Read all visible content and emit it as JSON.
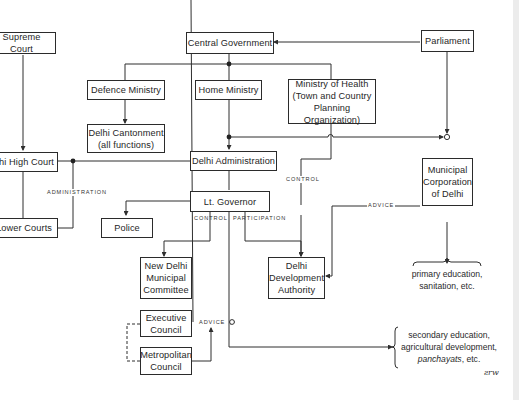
{
  "nodes": {
    "supreme_court": "Supreme Court",
    "central_government": "Central Government",
    "parliament": "Parliament",
    "defence_ministry": "Defence Ministry",
    "home_ministry": "Home Ministry",
    "ministry_of_health": "Ministry of Health\n(Town and Country\nPlanning Organization)",
    "delhi_cantonment": "Delhi Cantonment\n(all functions)",
    "delhi_high_court": "Delhi High Court",
    "delhi_administration": "Delhi Administration",
    "municipal_corporation": "Municipal\nCorporation\nof Delhi",
    "lower_courts": "Lower Courts",
    "police": "Police",
    "lt_governor": "Lt. Governor",
    "new_delhi_municipal_committee": "New Delhi\nMunicipal\nCommittee",
    "delhi_development_authority": "Delhi\nDevelopment\nAuthority",
    "executive_council": "Executive\nCouncil",
    "metropolitan_council": "Metropolitan\nCouncil"
  },
  "edge_labels": {
    "administration": "ADMINISTRATION",
    "control_health": "CONTROL",
    "advice_mcd": "ADVICE",
    "control_ltg": "CONTROL",
    "participation": "PARTICIPATION",
    "advice_council": "ADVICE"
  },
  "notes": {
    "mcd_functions_line1": "primary education,",
    "mcd_functions_line2": "sanitation, etc.",
    "admin_functions_line1": "secondary education,",
    "admin_functions_line2": "agricultural development,",
    "admin_functions_line3_italic": "panchayats",
    "admin_functions_line3_rest": ", etc.",
    "signature": "ƨrw"
  }
}
